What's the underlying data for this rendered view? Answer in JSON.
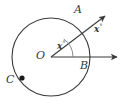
{
  "figure": {
    "type": "geometry-diagram",
    "stroke_color": "#3a3a3a",
    "background_color": "#ffffff"
  },
  "circle": {
    "center_label": "O",
    "center_x": 51,
    "center_y": 57,
    "radius": 39
  },
  "points": [
    {
      "label": "A",
      "x": 80,
      "y": 31,
      "label_x": 74,
      "label_y": 7,
      "on_circle": true,
      "marked": false
    },
    {
      "label": "B",
      "x": 90,
      "y": 57,
      "label_x": 79,
      "label_y": 64,
      "on_circle": true,
      "marked": false
    },
    {
      "label": "C",
      "x": 22,
      "y": 78,
      "label_x": 9,
      "label_y": 78,
      "on_circle": true,
      "marked": true
    },
    {
      "label": "O",
      "x": 51,
      "y": 57,
      "label_x": 37,
      "label_y": 52,
      "on_circle": false,
      "marked": false
    }
  ],
  "rays": [
    {
      "name": "ray-OA",
      "from": "O",
      "through": "A",
      "arrow": true,
      "end_x": 110,
      "end_y": 12
    },
    {
      "name": "ray-OB",
      "from": "O",
      "through": "B",
      "arrow": true,
      "end_x": 122,
      "end_y": 57
    }
  ],
  "angles": [
    {
      "name": "inner-angle-AOB",
      "label": "x",
      "unit": "°",
      "label_x": 58,
      "label_y": 44,
      "arc_radius": 22,
      "vertex": "O"
    },
    {
      "name": "outer-angle-label",
      "label": "x",
      "unit": "°",
      "label_x": 95,
      "label_y": 27,
      "arc_radius": 0,
      "vertex": "A"
    }
  ]
}
